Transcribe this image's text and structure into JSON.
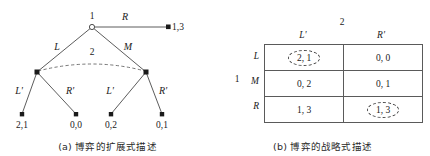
{
  "figure": {
    "panel_a": {
      "caption": "(a) 博弈的扩展式描述",
      "tree": {
        "root_player_label": "1",
        "info_set_label": "2",
        "edges": {
          "root_left": "L",
          "root_middle": "M",
          "root_right": "R",
          "left_node_left": "L'",
          "left_node_right": "R'",
          "right_node_left": "L'",
          "right_node_right": "R'"
        },
        "terminals": {
          "root_right": "1,3",
          "left_left": "2,1",
          "left_right": "0,0",
          "right_left": "0,2",
          "right_right": "0,1"
        }
      }
    },
    "panel_b": {
      "caption": "(b) 博弈的战略式描述",
      "matrix": {
        "column_player": "2",
        "row_player": "1",
        "column_headers": [
          "L'",
          "R'"
        ],
        "row_headers": [
          "L",
          "M",
          "R"
        ],
        "cells": [
          [
            {
              "text": "2, 1",
              "circled": true
            },
            {
              "text": "0, 0",
              "circled": false
            }
          ],
          [
            {
              "text": "0, 2",
              "circled": false
            },
            {
              "text": "0, 1",
              "circled": false
            }
          ],
          [
            {
              "text": "1, 3",
              "circled": false
            },
            {
              "text": "1, 3",
              "circled": true
            }
          ]
        ]
      }
    }
  }
}
